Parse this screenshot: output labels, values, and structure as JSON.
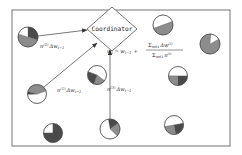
{
  "diagram": {
    "type": "federated-learning-coordinator",
    "frame": {
      "x": 12,
      "y": 10,
      "width": 218,
      "height": 136,
      "stroke": "#8a8a8a"
    },
    "coordinator": {
      "label": "Coordinator",
      "shape": "diamond",
      "cx": 112,
      "cy": 29,
      "half_w": 25,
      "half_h": 22
    },
    "update_rule": {
      "lhs": "w",
      "lhs_sub": "t",
      "eq": "=",
      "prev": "w",
      "prev_sub": "t−1",
      "plus": "+",
      "numerator": "Σ",
      "numerator_sub": "m∈I",
      "numerator_rest": "Δw",
      "numerator_sup": "(i)",
      "denominator": "Σ",
      "denominator_sub": "m∈I",
      "denominator_rest": "n",
      "denominator_sup": "(i)"
    },
    "edge_labels": [
      {
        "id": "client2",
        "coef": "n",
        "sup": "(2)",
        "rest": "Δw",
        "sub": "t−1",
        "x": 40,
        "y": 48
      },
      {
        "id": "client1",
        "coef": "n",
        "sup": "(1)",
        "rest": "Δw",
        "sub": "t−1",
        "x": 57,
        "y": 92
      },
      {
        "id": "client3",
        "coef": "n",
        "sup": "(3)",
        "rest": "Δw",
        "sub": "t−1",
        "x": 107,
        "y": 91
      }
    ],
    "colors": {
      "dark": "#4a4a4a",
      "mid": "#8c8c8c",
      "light": "#ffffff",
      "outline": "#444444"
    },
    "clients": [
      {
        "name": "client-top-left",
        "cx": 28,
        "cy": 37,
        "r": 10,
        "slices": [
          {
            "color": "dark",
            "frac": 0.3
          },
          {
            "color": "mid",
            "frac": 0.5
          },
          {
            "color": "light",
            "frac": 0.2
          }
        ],
        "start": -90
      },
      {
        "name": "client-mid-left",
        "cx": 37,
        "cy": 94,
        "r": 9.5,
        "slices": [
          {
            "color": "light",
            "frac": 0.55
          },
          {
            "color": "dark",
            "frac": 0.05
          },
          {
            "color": "mid",
            "frac": 0.4
          }
        ],
        "start": -20
      },
      {
        "name": "client-bottom-left",
        "cx": 53,
        "cy": 133,
        "r": 9.5,
        "slices": [
          {
            "color": "light",
            "frac": 0.25
          },
          {
            "color": "dark",
            "frac": 0.75
          }
        ],
        "start": 180
      },
      {
        "name": "client-center",
        "cx": 97,
        "cy": 75,
        "r": 9.5,
        "slices": [
          {
            "color": "light",
            "frac": 0.55
          },
          {
            "color": "mid",
            "frac": 0.2
          },
          {
            "color": "dark",
            "frac": 0.25
          }
        ],
        "start": -160
      },
      {
        "name": "client-bottom-center",
        "cx": 110,
        "cy": 129,
        "r": 10,
        "slices": [
          {
            "color": "dark",
            "frac": 0.18
          },
          {
            "color": "mid",
            "frac": 0.22
          },
          {
            "color": "light",
            "frac": 0.6
          }
        ],
        "start": -100
      },
      {
        "name": "client-top-right",
        "cx": 163,
        "cy": 25,
        "r": 10,
        "slices": [
          {
            "color": "light",
            "frac": 0.5
          },
          {
            "color": "mid",
            "frac": 0.5
          }
        ],
        "start": 160
      },
      {
        "name": "client-far-right",
        "cx": 210,
        "cy": 44,
        "r": 10,
        "slices": [
          {
            "color": "mid",
            "frac": 0.85
          },
          {
            "color": "light",
            "frac": 0.15
          }
        ],
        "start": -30
      },
      {
        "name": "client-mid-right",
        "cx": 178,
        "cy": 76,
        "r": 9.5,
        "slices": [
          {
            "color": "light",
            "frac": 0.5
          },
          {
            "color": "dark",
            "frac": 0.25
          },
          {
            "color": "mid",
            "frac": 0.25
          }
        ],
        "start": 180
      },
      {
        "name": "client-bottom-right",
        "cx": 174,
        "cy": 125,
        "r": 9.5,
        "slices": [
          {
            "color": "light",
            "frac": 0.5
          },
          {
            "color": "dark",
            "frac": 0.25
          },
          {
            "color": "mid",
            "frac": 0.25
          }
        ],
        "start": 170
      }
    ],
    "edges": [
      {
        "from": "client-top-left",
        "x1": 38,
        "y1": 36,
        "x2": 87,
        "y2": 30
      },
      {
        "from": "client-mid-left",
        "x1": 44,
        "y1": 87,
        "x2": 97,
        "y2": 43
      },
      {
        "from": "client-bottom-center",
        "x1": 110,
        "y1": 119,
        "x2": 110,
        "y2": 50
      }
    ]
  }
}
